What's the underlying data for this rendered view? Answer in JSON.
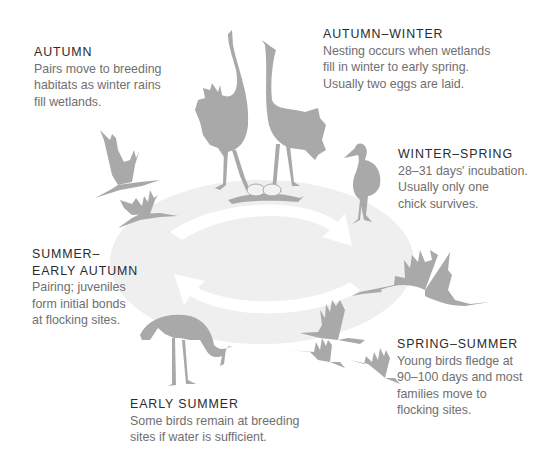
{
  "diagram": {
    "type": "life-cycle",
    "colors": {
      "bird_silhouette": "#a9a9a9",
      "cycle_ellipse": "#efefef",
      "cycle_arrows": "#ffffff",
      "title_text": "#2b2b2b",
      "body_text": "#6f6f6f"
    },
    "stages": [
      {
        "id": "autumn",
        "title": "AUTUMN",
        "body": "Pairs move to breeding\nhabitats as winter rains\nfill wetlands."
      },
      {
        "id": "autumn-winter",
        "title": "AUTUMN–WINTER",
        "body": "Nesting occurs when wetlands\nfill in winter to early spring.\nUsually two eggs are laid."
      },
      {
        "id": "winter-spring",
        "title": "WINTER–SPRING",
        "body": "28–31 days' incubation.\nUsually only one\nchick survives."
      },
      {
        "id": "spring-summer",
        "title": "SPRING–SUMMER",
        "body": "Young birds fledge at\n90–100 days and most\nfamilies move to\nflocking sites."
      },
      {
        "id": "early-summer",
        "title": "EARLY SUMMER",
        "body": "Some birds remain at breeding\nsites if water is sufficient."
      },
      {
        "id": "summer-early-autumn",
        "title": "SUMMER–\nEARLY AUTUMN",
        "body": "Pairing; juveniles\nform initial bonds\nat flocking sites."
      }
    ],
    "illustrations": [
      "two-cranes-dancing-icon",
      "nest-with-two-eggs-icon",
      "crane-chick-icon",
      "flying-crane-large-icon",
      "flying-cranes-group-icon",
      "feeding-crane-icon",
      "flying-cranes-pair-icon",
      "cycle-arrows-icon"
    ]
  }
}
